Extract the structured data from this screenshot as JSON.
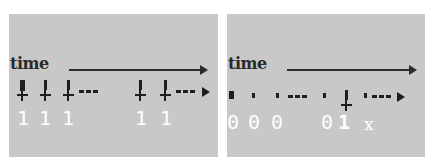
{
  "panels": [
    {
      "id": "left",
      "axis_label": "time",
      "events": [
        {
          "type": "spike",
          "x": 8,
          "size": "big"
        },
        {
          "type": "spike",
          "x": 31
        },
        {
          "type": "spike",
          "x": 54
        },
        {
          "type": "ellipsis",
          "x": 79
        },
        {
          "type": "spike",
          "x": 128
        },
        {
          "type": "spike",
          "x": 153
        },
        {
          "type": "ellipsis-arrow",
          "x": 175
        }
      ],
      "bits": [
        "1",
        "1",
        "1",
        "1",
        "1"
      ],
      "bit_positions": [
        11,
        34,
        57,
        131,
        156
      ]
    },
    {
      "id": "right",
      "axis_label": "time",
      "events": [
        {
          "type": "dot-big",
          "x": 3
        },
        {
          "type": "dot",
          "x": 27
        },
        {
          "type": "dot",
          "x": 50
        },
        {
          "type": "ellipsis",
          "x": 68
        },
        {
          "type": "dot",
          "x": 103
        },
        {
          "type": "spike",
          "x": 114
        },
        {
          "type": "dot",
          "x": 143
        },
        {
          "type": "ellipsis-arrow",
          "x": 154
        }
      ],
      "bits": [
        "0",
        "0",
        "0",
        "0",
        "1",
        "x"
      ],
      "bit_positions": [
        0,
        21,
        44,
        94,
        112,
        137
      ]
    }
  ],
  "colors": {
    "panel_background": "#c8c8c8",
    "ink": "#1e1e1e",
    "bit_text": "#ffffff"
  }
}
